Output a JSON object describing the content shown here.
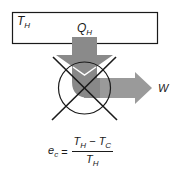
{
  "diagram": {
    "reservoir": {
      "label": "T",
      "label_sub": "H",
      "border_color": "#1a1a1a",
      "fill_color": "#ffffff"
    },
    "heat_in": {
      "label": "Q",
      "label_sub": "H",
      "arrow_color": "#8c8c8c"
    },
    "work_out": {
      "label": "W",
      "arrow_color": "#999999"
    },
    "engine": {
      "symbol": "crossed-circle",
      "stroke_color": "#1a1a1a"
    },
    "equation": {
      "lhs": "e",
      "lhs_sub": "c",
      "equals": "=",
      "numerator_a": "T",
      "numerator_a_sub": "H",
      "minus": " − ",
      "numerator_b": "T",
      "numerator_b_sub": "C",
      "denominator": "T",
      "denominator_sub": "H"
    }
  }
}
